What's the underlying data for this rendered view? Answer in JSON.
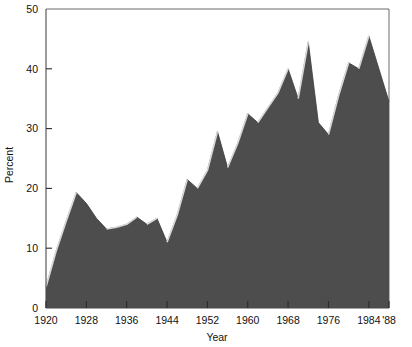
{
  "figure": {
    "width": 412,
    "height": 347,
    "background": "#ffffff"
  },
  "labels": {
    "xlabel": "Year",
    "ylabel": "Percent"
  },
  "axis": {
    "y_ticks": [
      "0",
      "10",
      "20",
      "30",
      "40",
      "50"
    ],
    "x_ticks": [
      "1920",
      "1928",
      "1936",
      "1944",
      "1952",
      "1960",
      "1968",
      "1976",
      "1984",
      "'88"
    ]
  },
  "colors": {
    "fill": "#4d4d4d",
    "highlight": "#d8d8d8",
    "axis": "#4a4a4a",
    "frame": "#6a6a6a",
    "text": "#111111"
  },
  "chart_data": {
    "type": "area",
    "title": "",
    "xlabel": "Year",
    "ylabel": "Percent",
    "xlim": [
      1920,
      1988
    ],
    "ylim": [
      0,
      50
    ],
    "grid": false,
    "legend": "none",
    "x_tick_values": [
      1920,
      1928,
      1936,
      1944,
      1952,
      1960,
      1968,
      1976,
      1984,
      1988
    ],
    "x_tick_labels": [
      "1920",
      "1928",
      "1936",
      "1944",
      "1952",
      "1960",
      "1968",
      "1976",
      "1984",
      "'88"
    ],
    "y_tick_values": [
      0,
      10,
      20,
      30,
      40,
      50
    ],
    "y_tick_labels": [
      "0",
      "10",
      "20",
      "30",
      "40",
      "50"
    ],
    "x": [
      1920,
      1922,
      1924,
      1926,
      1928,
      1930,
      1932,
      1934,
      1936,
      1938,
      1940,
      1942,
      1944,
      1946,
      1948,
      1950,
      1952,
      1954,
      1956,
      1958,
      1960,
      1962,
      1964,
      1966,
      1968,
      1970,
      1972,
      1974,
      1976,
      1978,
      1980,
      1982,
      1984,
      1986,
      1988
    ],
    "values": [
      3.5,
      9.5,
      14.5,
      19.3,
      17.5,
      15.0,
      13.2,
      13.5,
      14.0,
      15.2,
      14.0,
      15.0,
      11.0,
      15.5,
      21.5,
      20.0,
      23.0,
      29.5,
      23.5,
      27.5,
      32.5,
      31.0,
      33.5,
      36.0,
      40.0,
      35.0,
      44.5,
      31.0,
      29.0,
      35.5,
      41.0,
      40.0,
      45.5,
      40.0,
      34.5
    ],
    "series": [
      {
        "name": "Percent",
        "values": [
          3.5,
          9.5,
          14.5,
          19.3,
          17.5,
          15.0,
          13.2,
          13.5,
          14.0,
          15.2,
          14.0,
          15.0,
          11.0,
          15.5,
          21.5,
          20.0,
          23.0,
          29.5,
          23.5,
          27.5,
          32.5,
          31.0,
          33.5,
          36.0,
          40.0,
          35.0,
          44.5,
          31.0,
          29.0,
          35.5,
          41.0,
          40.0,
          45.5,
          40.0,
          34.5
        ]
      }
    ]
  }
}
